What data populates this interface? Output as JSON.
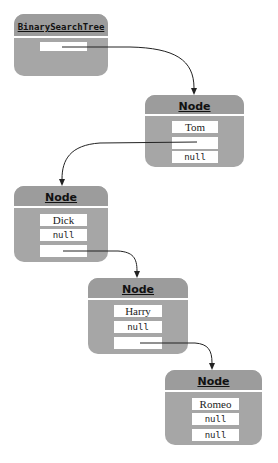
{
  "diagram": {
    "tree": {
      "class_name": "BinarySearchTree",
      "root_field": ""
    },
    "nodes": [
      {
        "class_name": "Node",
        "fields": [
          "Tom",
          "",
          "null"
        ]
      },
      {
        "class_name": "Node",
        "fields": [
          "Dick",
          "null",
          ""
        ]
      },
      {
        "class_name": "Node",
        "fields": [
          "Harry",
          "null",
          ""
        ]
      },
      {
        "class_name": "Node",
        "fields": [
          "Romeo",
          "null",
          "null"
        ]
      }
    ],
    "colors": {
      "box_body": "#a6a6a6",
      "box_header": "#9c9c9c",
      "field_bg": "#ffffff",
      "arrow": "#222222"
    }
  }
}
